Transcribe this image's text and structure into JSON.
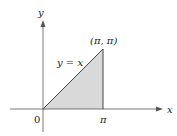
{
  "diagram": {
    "axes": {
      "x_label": "x",
      "y_label": "y"
    },
    "origin_label": "0",
    "x_tick_label": "π",
    "point_label": "(π, π)",
    "line_label": "y = x",
    "region": {
      "vertices": [
        "(0,0)",
        "(π,π)",
        "(π,0)"
      ],
      "fill": "#d9d9d9"
    },
    "colors": {
      "axis": "#555555",
      "line": "#444444"
    }
  }
}
